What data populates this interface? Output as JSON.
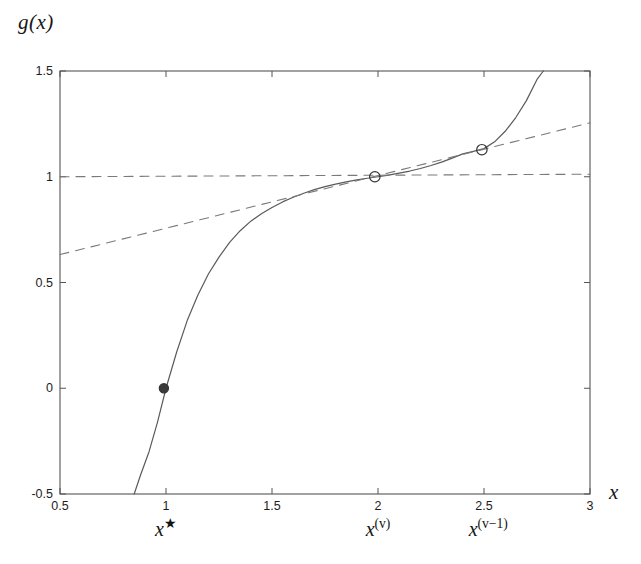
{
  "figure": {
    "background_color": "#ffffff",
    "axis_color": "#555555",
    "curve_color": "#5a5a5a",
    "dash_color": "#7a7a7a",
    "marker_edge_color": "#333333",
    "marker_fill_color": "#3a3a3a",
    "y_axis_title": "g(x)",
    "x_axis_title": "x"
  },
  "annotations": [
    {
      "id": "root",
      "x_value": 1.0,
      "base": "x",
      "sup": "★",
      "sup_kind": "star"
    },
    {
      "id": "iterate-v",
      "x_value": 2.0,
      "base": "x",
      "sup": "(v)",
      "sup_kind": "paren"
    },
    {
      "id": "iterate-v-minus-1",
      "x_value": 2.52,
      "base": "x",
      "sup": "(v−1)",
      "sup_kind": "paren"
    }
  ],
  "chart_data": {
    "type": "line",
    "title": "",
    "xlabel": "x",
    "ylabel": "g(x)",
    "xlim": [
      0.5,
      3
    ],
    "ylim": [
      -0.5,
      1.5
    ],
    "xticks": [
      0.5,
      1,
      1.5,
      2,
      2.5,
      3
    ],
    "xticklabels": [
      "0.5",
      "1",
      "1.5",
      "2",
      "2.5",
      "3"
    ],
    "yticks": [
      -0.5,
      0,
      0.5,
      1,
      1.5
    ],
    "yticklabels": [
      "-0.5",
      "0",
      "0.5",
      "1",
      "1.5"
    ],
    "grid": false,
    "legend": null,
    "series": [
      {
        "name": "g(x)",
        "style": "solid",
        "color": "#5a5a5a",
        "x": [
          0.85,
          0.88,
          0.92,
          0.96,
          1.0,
          1.05,
          1.1,
          1.15,
          1.2,
          1.25,
          1.3,
          1.35,
          1.4,
          1.45,
          1.5,
          1.55,
          1.6,
          1.65,
          1.7,
          1.75,
          1.8,
          1.85,
          1.9,
          1.95,
          2.0,
          2.05,
          2.1,
          2.15,
          2.2,
          2.25,
          2.3,
          2.35,
          2.4,
          2.45,
          2.5,
          2.55,
          2.6,
          2.65,
          2.7,
          2.75,
          2.78
        ],
        "y": [
          -0.5,
          -0.41,
          -0.3,
          -0.16,
          0.0,
          0.17,
          0.32,
          0.44,
          0.54,
          0.62,
          0.69,
          0.745,
          0.79,
          0.825,
          0.855,
          0.881,
          0.903,
          0.922,
          0.939,
          0.953,
          0.965,
          0.976,
          0.985,
          0.993,
          1.0,
          1.008,
          1.017,
          1.027,
          1.039,
          1.053,
          1.069,
          1.088,
          1.108,
          1.12,
          1.133,
          1.165,
          1.215,
          1.28,
          1.36,
          1.46,
          1.5
        ]
      },
      {
        "name": "horizontal-asymptote-line",
        "style": "dashed",
        "color": "#7a7a7a",
        "x": [
          0.5,
          3.0
        ],
        "y": [
          1.0,
          1.012
        ]
      },
      {
        "name": "secant-line",
        "style": "dashed",
        "color": "#7a7a7a",
        "x": [
          0.5,
          3.0
        ],
        "y": [
          0.632,
          1.255
        ]
      }
    ],
    "markers": [
      {
        "name": "root-marker",
        "x": 0.99,
        "y": 0.0,
        "style": "filled-circle"
      },
      {
        "name": "iterate-v-marker",
        "x": 1.985,
        "y": 1.0,
        "style": "open-circle"
      },
      {
        "name": "iterate-v-minus-1-marker",
        "x": 2.49,
        "y": 1.128,
        "style": "open-circle"
      }
    ]
  }
}
